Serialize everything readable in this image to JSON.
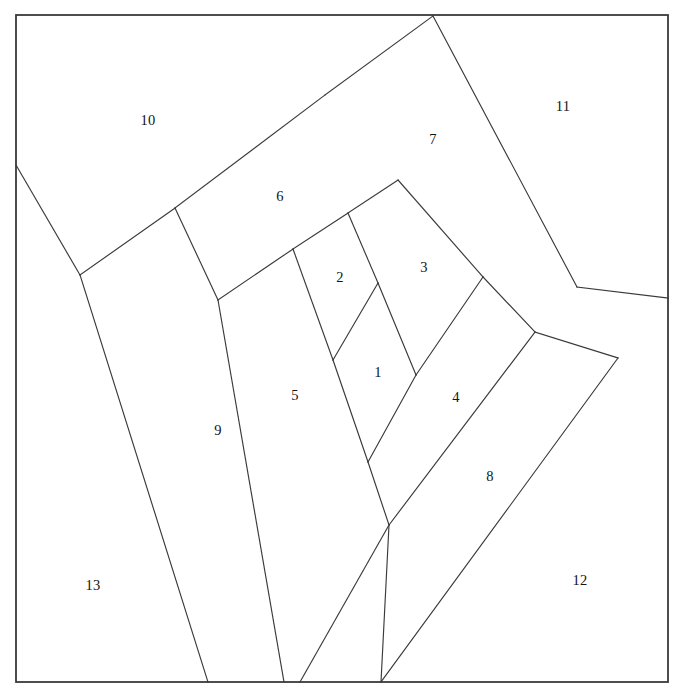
{
  "figure": {
    "background_color": "#ffffff",
    "line_color": "#3a3a3a",
    "label_color": "#141414",
    "canvas": {
      "width": 674,
      "height": 691
    }
  },
  "frame": {
    "name": "outer-square-border",
    "x": 16,
    "y": 15,
    "width": 652,
    "height": 667,
    "stroke_width": 1.8
  },
  "regions": [
    {
      "id": "region-1",
      "label": "1",
      "label_x": 378,
      "label_y": 374,
      "points": "378,283 333,360 368,462 416,375"
    },
    {
      "id": "region-2",
      "label": "2",
      "label_x": 340,
      "label_y": 279,
      "points": "293,249 348,213 378,283 333,360"
    },
    {
      "id": "region-3",
      "label": "3",
      "label_x": 424,
      "label_y": 269,
      "points": "348,213 398,180 483,277 416,375 378,283"
    },
    {
      "id": "region-4",
      "label": "4",
      "label_x": 456,
      "label_y": 399,
      "points": "483,277 535,332 389,525 368,462 416,375"
    },
    {
      "id": "region-5",
      "label": "5",
      "label_x": 295,
      "label_y": 397,
      "points": "218,300 293,249 333,360 368,462 389,525 300,682 284,682"
    },
    {
      "id": "region-6",
      "label": "6",
      "label_x": 280,
      "label_y": 198,
      "points": "175,208 325,95 398,180 348,213 293,249 218,300"
    },
    {
      "id": "region-7",
      "label": "7",
      "label_x": 433,
      "label_y": 141,
      "points": "325,95 433,16 577,287 535,332 483,277 398,180"
    },
    {
      "id": "region-8",
      "label": "8",
      "label_x": 490,
      "label_y": 478,
      "points": "535,332 618,358 381,682 300,682 389,525"
    },
    {
      "id": "region-9",
      "label": "9",
      "label_x": 218,
      "label_y": 432,
      "points": "80,275 175,208 218,300 284,682 300,682 284,682 208,682"
    },
    {
      "id": "region-10",
      "label": "10",
      "label_x": 148,
      "label_y": 122,
      "points": "16,15 433,16 325,95 175,208 80,275 16,165"
    },
    {
      "id": "region-11",
      "label": "11",
      "label_x": 563,
      "label_y": 108,
      "points": "433,16 668,15 668,298 577,287"
    },
    {
      "id": "region-12",
      "label": "12",
      "label_x": 580,
      "label_y": 582,
      "points": "668,298 668,682 381,682 618,358"
    },
    {
      "id": "region-13",
      "label": "13",
      "label_x": 93,
      "label_y": 587,
      "points": "16,165 80,275 208,682 16,682"
    }
  ],
  "cut_lines": [
    {
      "name": "cut-10-9",
      "x1": 16,
      "y1": 165,
      "x2": 80,
      "y2": 275
    },
    {
      "name": "cut-9-13",
      "x1": 80,
      "y1": 275,
      "x2": 208,
      "y2": 682
    },
    {
      "name": "cut-10-6",
      "x1": 80,
      "y1": 275,
      "x2": 175,
      "y2": 208
    },
    {
      "name": "cut-6-edge",
      "x1": 175,
      "y1": 208,
      "x2": 325,
      "y2": 95
    },
    {
      "name": "cut-7-10",
      "x1": 325,
      "y1": 95,
      "x2": 433,
      "y2": 16
    },
    {
      "name": "cut-7-11",
      "x1": 433,
      "y1": 16,
      "x2": 577,
      "y2": 287
    },
    {
      "name": "cut-11-12",
      "x1": 577,
      "y1": 287,
      "x2": 668,
      "y2": 298
    },
    {
      "name": "cut-9-5",
      "x1": 175,
      "y1": 208,
      "x2": 218,
      "y2": 300
    },
    {
      "name": "cut-5-9b",
      "x1": 218,
      "y1": 300,
      "x2": 284,
      "y2": 682
    },
    {
      "name": "cut-6-5",
      "x1": 218,
      "y1": 300,
      "x2": 293,
      "y2": 249
    },
    {
      "name": "cut-6-2",
      "x1": 293,
      "y1": 249,
      "x2": 348,
      "y2": 213
    },
    {
      "name": "cut-6-3",
      "x1": 348,
      "y1": 213,
      "x2": 398,
      "y2": 180
    },
    {
      "name": "cut-7-3",
      "x1": 398,
      "y1": 180,
      "x2": 483,
      "y2": 277
    },
    {
      "name": "cut-7-4",
      "x1": 483,
      "y1": 277,
      "x2": 535,
      "y2": 332
    },
    {
      "name": "cut-8-12",
      "x1": 535,
      "y1": 332,
      "x2": 618,
      "y2": 358
    },
    {
      "name": "cut-12-8b",
      "x1": 618,
      "y1": 358,
      "x2": 381,
      "y2": 682
    },
    {
      "name": "cut-5-2",
      "x1": 293,
      "y1": 249,
      "x2": 333,
      "y2": 360
    },
    {
      "name": "cut-5-1",
      "x1": 333,
      "y1": 360,
      "x2": 368,
      "y2": 462
    },
    {
      "name": "cut-5-8",
      "x1": 368,
      "y1": 462,
      "x2": 389,
      "y2": 525
    },
    {
      "name": "cut-5-bot",
      "x1": 389,
      "y1": 525,
      "x2": 300,
      "y2": 682
    },
    {
      "name": "cut-2-1",
      "x1": 333,
      "y1": 360,
      "x2": 378,
      "y2": 283
    },
    {
      "name": "cut-2-3",
      "x1": 348,
      "y1": 213,
      "x2": 378,
      "y2": 283
    },
    {
      "name": "cut-1-3",
      "x1": 378,
      "y1": 283,
      "x2": 416,
      "y2": 375
    },
    {
      "name": "cut-1-4",
      "x1": 416,
      "y1": 375,
      "x2": 368,
      "y2": 462
    },
    {
      "name": "cut-3-4",
      "x1": 416,
      "y1": 375,
      "x2": 483,
      "y2": 277
    },
    {
      "name": "cut-4-8",
      "x1": 389,
      "y1": 525,
      "x2": 535,
      "y2": 332
    },
    {
      "name": "cut-8-bot",
      "x1": 389,
      "y1": 525,
      "x2": 381,
      "y2": 682
    }
  ]
}
